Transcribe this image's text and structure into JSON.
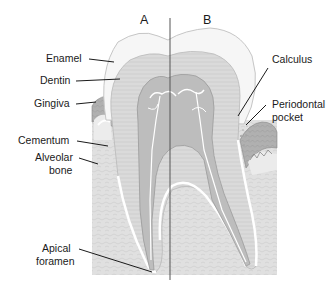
{
  "figure": {
    "side_labels": [
      {
        "id": "A",
        "text": "A"
      },
      {
        "id": "B",
        "text": "B"
      }
    ],
    "left_labels": [
      {
        "text": "Enamel"
      },
      {
        "text": "Dentin"
      },
      {
        "text": "Gingiva"
      },
      {
        "text": "Cementum"
      },
      {
        "text": "Alveolar",
        "line2": "bone"
      },
      {
        "text": "Apical",
        "line2": "foramen"
      }
    ],
    "right_labels": [
      {
        "text": "Calculus"
      },
      {
        "text": "Periodontal",
        "line2": "pocket"
      }
    ]
  },
  "colors": {
    "background": "#ffffff",
    "enamel": "#f4f4f4",
    "enamel_outline": "#c8c8c8",
    "dentin": "#d9d9d9",
    "dentin_lines": "#c6c6c6",
    "pulp": "#b8b8b8",
    "nerves": "#ffffff",
    "bone": "#dcdcdc",
    "gingiva": "#a9a9a9",
    "text": "#1a1a1a",
    "divider": "#555555"
  }
}
